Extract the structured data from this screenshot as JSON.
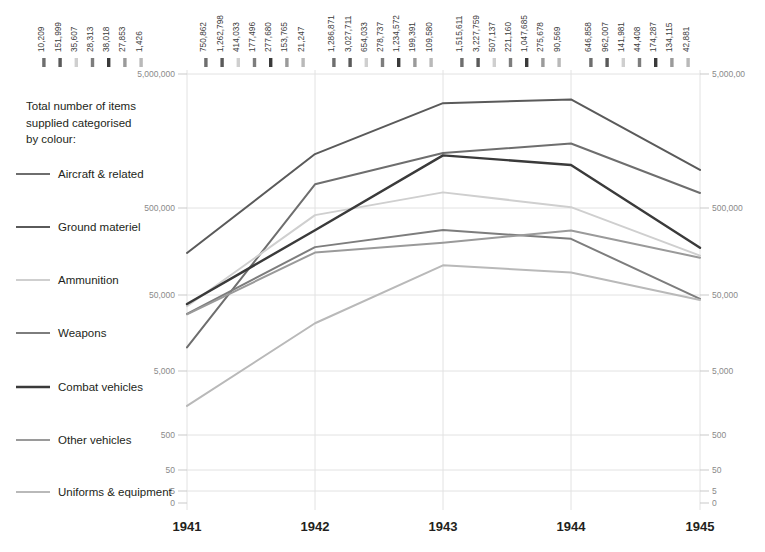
{
  "legend": {
    "title_line1": "Total number of items",
    "title_line2": "supplied categorised",
    "title_line3": "by colour:",
    "items": [
      {
        "label": "Aircraft & related",
        "color": "#6e6e6e"
      },
      {
        "label": "Ground materiel",
        "color": "#5a5a5a"
      },
      {
        "label": "Ammunition",
        "color": "#cfcfcf"
      },
      {
        "label": "Weapons",
        "color": "#7d7d7d"
      },
      {
        "label": "Combat vehicles",
        "color": "#3a3a3a"
      },
      {
        "label": "Other vehicles",
        "color": "#9a9a9a"
      },
      {
        "label": "Uniforms & equipment",
        "color": "#b9b9b9"
      }
    ]
  },
  "axis": {
    "left_top_label": "5,000,000",
    "right_top_label": "5,000,00",
    "ticks": [
      "5,000,000",
      "500,000",
      "50,000",
      "5,000",
      "500",
      "50",
      "5",
      "0"
    ]
  },
  "chart_data": {
    "type": "line",
    "xlabel": "",
    "ylabel": "",
    "yscale": "log",
    "ylim": [
      0,
      5000000
    ],
    "ytick_labels": [
      "5,000,000",
      "500,000",
      "50,000",
      "5,000",
      "500",
      "50",
      "5",
      "0"
    ],
    "ytick_values": [
      5000000,
      500000,
      50000,
      5000,
      500,
      50,
      5,
      0
    ],
    "grid": true,
    "legend_position": "left",
    "categories": [
      "1941",
      "1942",
      "1943",
      "1944",
      "1945"
    ],
    "series": [
      {
        "name": "Aircraft & related",
        "color": "#6e6e6e",
        "values": [
          10209,
          750862,
          1286871,
          1515611,
          646858
        ],
        "labels": [
          "10,209",
          "750,862",
          "1,286,871",
          "1,515,611",
          "646,858"
        ]
      },
      {
        "name": "Ground materiel",
        "color": "#5a5a5a",
        "values": [
          151999,
          1262798,
          3027711,
          3227759,
          962007
        ],
        "labels": [
          "151,999",
          "1,262,798",
          "3,027,711",
          "3,227,759",
          "962,007"
        ]
      },
      {
        "name": "Ammunition",
        "color": "#cfcfcf",
        "values": [
          35607,
          414033,
          654033,
          507137,
          141981
        ],
        "labels": [
          "35,607",
          "414,033",
          "654,033",
          "507,137",
          "141,981"
        ]
      },
      {
        "name": "Weapons",
        "color": "#7d7d7d",
        "values": [
          28313,
          177496,
          278737,
          221160,
          44408
        ],
        "labels": [
          "28,313",
          "177,496",
          "278,737",
          "221,160",
          "44,408"
        ]
      },
      {
        "name": "Combat vehicles",
        "color": "#3a3a3a",
        "values": [
          38018,
          277680,
          1234572,
          1047685,
          174287
        ],
        "labels": [
          "38,018",
          "277,680",
          "1,234,572",
          "1,047,685",
          "174,287"
        ]
      },
      {
        "name": "Other vehicles",
        "color": "#9a9a9a",
        "values": [
          27853,
          153765,
          199391,
          275678,
          134115
        ],
        "labels": [
          "27,853",
          "153,765",
          "199,391",
          "275,678",
          "134,115"
        ]
      },
      {
        "name": "Uniforms & equipment",
        "color": "#b9b9b9",
        "values": [
          1426,
          21247,
          109580,
          90569,
          42881
        ],
        "labels": [
          "1,426",
          "21,247",
          "109,580",
          "90,569",
          "42,881"
        ]
      }
    ],
    "value_label_groups": [
      {
        "year": "1941",
        "labels": [
          "10,209",
          "151,999",
          "35,607",
          "28,313",
          "38,018",
          "27,853",
          "1,426"
        ],
        "colors": [
          "#6e6e6e",
          "#5a5a5a",
          "#cfcfcf",
          "#7d7d7d",
          "#3a3a3a",
          "#9a9a9a",
          "#b9b9b9"
        ]
      },
      {
        "year": "1942",
        "labels": [
          "750,862",
          "1,262,798",
          "414,033",
          "177,496",
          "277,680",
          "153,765",
          "21,247"
        ],
        "colors": [
          "#6e6e6e",
          "#5a5a5a",
          "#cfcfcf",
          "#7d7d7d",
          "#3a3a3a",
          "#9a9a9a",
          "#b9b9b9"
        ]
      },
      {
        "year": "1943",
        "labels": [
          "1,286,871",
          "3,027,711",
          "654,033",
          "278,737",
          "1,234,572",
          "199,391",
          "109,580"
        ],
        "colors": [
          "#6e6e6e",
          "#5a5a5a",
          "#cfcfcf",
          "#7d7d7d",
          "#3a3a3a",
          "#9a9a9a",
          "#b9b9b9"
        ]
      },
      {
        "year": "1944",
        "labels": [
          "1,515,611",
          "3,227,759",
          "507,137",
          "221,160",
          "1,047,685",
          "275,678",
          "90,569"
        ],
        "colors": [
          "#6e6e6e",
          "#5a5a5a",
          "#cfcfcf",
          "#7d7d7d",
          "#3a3a3a",
          "#9a9a9a",
          "#b9b9b9"
        ]
      },
      {
        "year": "1945",
        "labels": [
          "646,858",
          "962,007",
          "141,981",
          "44,408",
          "174,287",
          "134,115",
          "42,881"
        ],
        "colors": [
          "#6e6e6e",
          "#5a5a5a",
          "#cfcfcf",
          "#7d7d7d",
          "#3a3a3a",
          "#9a9a9a",
          "#b9b9b9"
        ]
      }
    ]
  }
}
